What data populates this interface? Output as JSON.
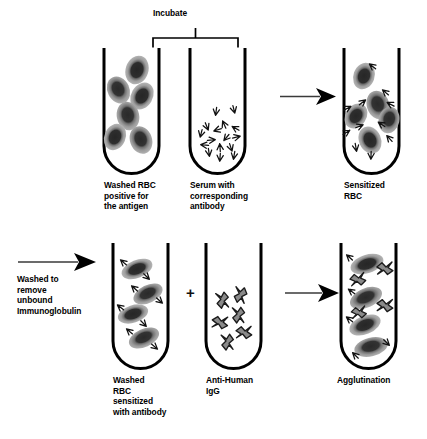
{
  "diagram": {
    "type": "laboratory-procedure-flow",
    "background_color": "#ffffff",
    "ink_color": "#000000",
    "rbc_core_color": "#2b2b2b",
    "rbc_halo_color": "#9b9b9b",
    "igg_fill_color": "#8e8e8e"
  },
  "annotations": {
    "incubate_label": "Incubate",
    "plus_sign": "+",
    "wash_step_text": "Washed to\nremove\nunbound\nImmunoglobulin"
  },
  "row1": {
    "tubes": [
      {
        "id": "washed-rbc-antigen",
        "label": "Washed RBC\npositive for\nthe antigen",
        "contents": "red-blood-cells",
        "cell_count": 6,
        "antibody_count": 0
      },
      {
        "id": "serum-antibody",
        "label": "Serum with\ncorresponding\nantibody",
        "contents": "free-antibodies",
        "cell_count": 0,
        "antibody_count": 16
      },
      {
        "id": "sensitized-rbc",
        "label": "Sensitized\nRBC",
        "contents": "antibody-coated-red-blood-cells",
        "cell_count": 5,
        "antibody_count": 11
      }
    ],
    "arrow": {
      "id": "incubate-arrow",
      "direction": "right"
    }
  },
  "row2": {
    "tubes": [
      {
        "id": "washed-sensitized-rbc",
        "label": "Washed\nRBC\nsensitized\nwith antibody",
        "contents": "washed-sensitized-red-blood-cells",
        "cell_count": 4,
        "antibody_count": 8
      },
      {
        "id": "anti-human-igg",
        "label": "Anti-Human\nIgG",
        "contents": "anti-human-globulin-reagent",
        "cell_count": 0,
        "igg_count": 6
      },
      {
        "id": "agglutination",
        "label": "Agglutination",
        "contents": "agglutinated-red-blood-cell-lattice",
        "cell_count": 4,
        "igg_count": 3
      }
    ],
    "arrows": [
      {
        "id": "wash-arrow",
        "direction": "right"
      },
      {
        "id": "add-aghg-arrow",
        "direction": "right"
      }
    ]
  }
}
